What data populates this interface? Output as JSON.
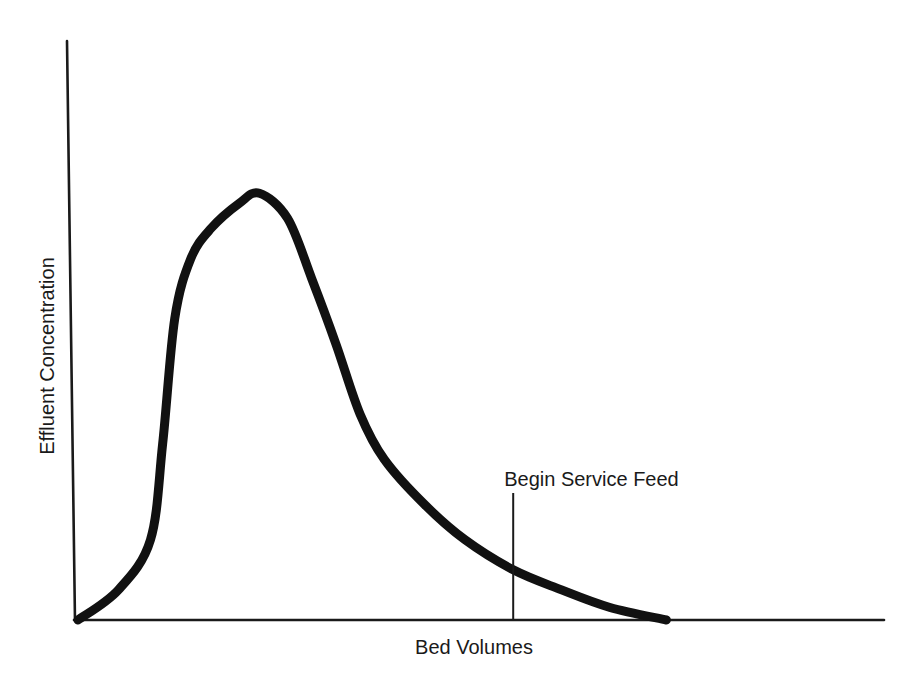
{
  "chart_data": {
    "type": "line",
    "title": "",
    "xlabel": "Bed Volumes",
    "ylabel": "Effluent Concentration",
    "x_ticks": [],
    "y_ticks": [],
    "grid": false,
    "legend": null,
    "units": "relative (unscaled axes)",
    "series": [
      {
        "name": "Effluent concentration curve",
        "x": [
          0.0,
          0.05,
          0.09,
          0.105,
          0.12,
          0.14,
          0.165,
          0.2,
          0.225,
          0.26,
          0.29,
          0.32,
          0.35,
          0.38,
          0.43,
          0.48,
          0.54,
          0.6,
          0.66,
          0.73
        ],
        "y": [
          0.0,
          0.06,
          0.16,
          0.35,
          0.6,
          0.72,
          0.78,
          0.83,
          0.85,
          0.8,
          0.68,
          0.55,
          0.41,
          0.32,
          0.23,
          0.16,
          0.1,
          0.06,
          0.025,
          0.0
        ]
      }
    ],
    "xlim": [
      0,
      1
    ],
    "ylim": [
      0,
      1
    ],
    "annotations": [
      {
        "text": "Begin Service Feed",
        "x": 0.54,
        "type": "vertical-line"
      }
    ]
  },
  "axes": {
    "x_label": "Bed Volumes",
    "y_label": "Effluent Concentration"
  },
  "annotation": {
    "label": "Begin Service Feed"
  },
  "colors": {
    "ink": "#111111",
    "background": "#ffffff"
  }
}
